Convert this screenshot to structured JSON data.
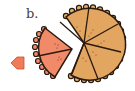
{
  "figure": {
    "label": "b.",
    "pie": {
      "slices_remaining": 5,
      "fill": "#e3a660",
      "crust": "#e8b070",
      "outline": "#2a1a10"
    },
    "removed_piece": {
      "slices": 2,
      "fill": "#f08a68",
      "outline": "#2a1a10"
    },
    "arrow": {
      "direction": "left",
      "fill": "#f07a5a"
    }
  }
}
